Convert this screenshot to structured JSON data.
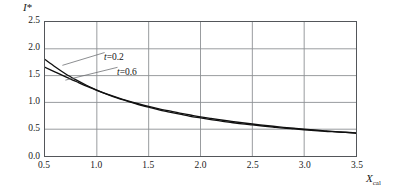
{
  "figure": {
    "background_color": "#ffffff",
    "frame_color": "#53565a",
    "grid_color": "#8c8f93",
    "curve_color": "#101010",
    "leader_color": "#6d7073"
  },
  "axes": {
    "y_title": "I",
    "y_title_superscript": "*",
    "x_title": "X",
    "x_title_subscript": "cal",
    "y_ticks": [
      "0.0",
      "0.5",
      "1.0",
      "1.5",
      "2.0",
      "2.5"
    ],
    "x_ticks": [
      "0.5",
      "1.0",
      "1.5",
      "2.0",
      "2.5",
      "3.0",
      "3.5"
    ]
  },
  "annotations": {
    "curve1_label_t": "t",
    "curve1_label_eq": "=0.2",
    "curve2_label_t": "t",
    "curve2_label_eq": "=0.6"
  },
  "chart_data": {
    "type": "line",
    "title": "",
    "xlabel": "X_cal",
    "ylabel": "I*",
    "xlim": [
      0.5,
      3.5
    ],
    "ylim": [
      0.0,
      2.5
    ],
    "xticks": [
      0.5,
      1.0,
      1.5,
      2.0,
      2.5,
      3.0,
      3.5
    ],
    "yticks": [
      0.0,
      0.5,
      1.0,
      1.5,
      2.0,
      2.5
    ],
    "grid": true,
    "legend": "inline-labels-with-leader-lines",
    "series": [
      {
        "name": "t=0.2",
        "x": [
          0.5,
          0.6,
          0.7,
          0.8,
          0.9,
          1.0,
          1.1,
          1.2,
          1.3,
          1.4,
          1.5,
          1.6,
          1.7,
          1.8,
          1.9,
          2.0,
          2.1,
          2.2,
          2.3,
          2.4,
          2.5,
          2.6,
          2.7,
          2.8,
          2.9,
          3.0,
          3.1,
          3.2,
          3.3,
          3.4,
          3.5
        ],
        "values": [
          1.8,
          1.66,
          1.53,
          1.42,
          1.32,
          1.23,
          1.15,
          1.08,
          1.02,
          0.96,
          0.91,
          0.86,
          0.82,
          0.78,
          0.74,
          0.71,
          0.68,
          0.65,
          0.625,
          0.6,
          0.58,
          0.56,
          0.54,
          0.52,
          0.505,
          0.49,
          0.475,
          0.46,
          0.45,
          0.44,
          0.425
        ]
      },
      {
        "name": "t=0.6",
        "x": [
          0.5,
          0.6,
          0.7,
          0.8,
          0.9,
          1.0,
          1.1,
          1.2,
          1.3,
          1.4,
          1.5,
          1.6,
          1.7,
          1.8,
          1.9,
          2.0,
          2.1,
          2.2,
          2.3,
          2.4,
          2.5,
          2.6,
          2.7,
          2.8,
          2.9,
          3.0,
          3.1,
          3.2,
          3.3,
          3.4,
          3.5
        ],
        "values": [
          1.655,
          1.565,
          1.475,
          1.39,
          1.305,
          1.225,
          1.155,
          1.09,
          1.03,
          0.975,
          0.925,
          0.88,
          0.84,
          0.8,
          0.765,
          0.73,
          0.7,
          0.672,
          0.645,
          0.62,
          0.597,
          0.575,
          0.555,
          0.535,
          0.518,
          0.5,
          0.485,
          0.47,
          0.455,
          0.443,
          0.43
        ]
      }
    ]
  }
}
